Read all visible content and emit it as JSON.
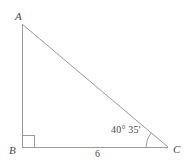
{
  "figure": {
    "kind": "right-triangle-geometry-diagram",
    "colors": {
      "stroke": "#9a9a9a",
      "text": "#4a4a4a",
      "background": "#ffffff"
    },
    "stroke_width": 1
  },
  "vertices": [
    {
      "id": "A",
      "label": "A",
      "x": 22,
      "y": 24,
      "label_x": 15,
      "label_y": 11
    },
    {
      "id": "B",
      "label": "B",
      "x": 22,
      "y": 147,
      "label_x": 9,
      "label_y": 145
    },
    {
      "id": "C",
      "label": "C",
      "x": 168,
      "y": 147,
      "label_x": 173,
      "label_y": 144
    }
  ],
  "sides": [
    {
      "id": "AB",
      "from": "A",
      "to": "B",
      "label": ""
    },
    {
      "id": "BC",
      "from": "B",
      "to": "C",
      "label": "6"
    },
    {
      "id": "AC",
      "from": "A",
      "to": "C",
      "label": ""
    }
  ],
  "markers": {
    "right_angle": {
      "at_vertex": "B",
      "size": 12,
      "label": ""
    },
    "angle_arc": {
      "at_vertex": "C",
      "radius": 22,
      "label": "40° 35'",
      "degrees": 40,
      "minutes": 35
    }
  },
  "labels": {
    "vertex_a": "A",
    "vertex_b": "B",
    "vertex_c": "C",
    "side_bc_length": "6",
    "angle_c": "40° 35'"
  }
}
